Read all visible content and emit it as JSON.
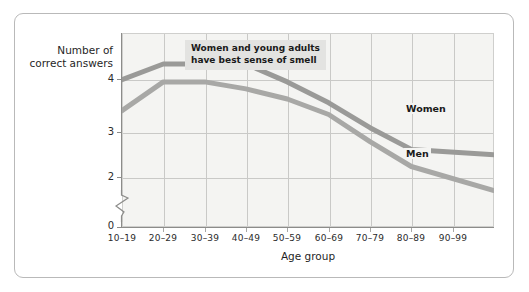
{
  "chart_data": {
    "type": "line",
    "title": "",
    "subtitle": "",
    "xlabel": "Age group",
    "ylabel": "Number of correct answers",
    "categories": [
      "10–19",
      "20–29",
      "30–39",
      "40–49",
      "50–59",
      "60–69",
      "70–79",
      "80–89",
      "90–99"
    ],
    "ytick_labels": [
      "0",
      "2",
      "3",
      "4"
    ],
    "ytick_values": [
      0,
      2,
      3,
      4
    ],
    "ylim": [
      1.85,
      4.35
    ],
    "y_axis_break": true,
    "grid": true,
    "legend_position": "inline-right",
    "series": [
      {
        "name": "Women",
        "color": "#9a9a98",
        "values": [
          3.75,
          3.95,
          3.95,
          3.95,
          3.72,
          3.45,
          3.13,
          2.85,
          2.78
        ]
      },
      {
        "name": "Men",
        "color": "#a8a8a6",
        "values": [
          3.35,
          3.72,
          3.72,
          3.63,
          3.5,
          3.3,
          2.95,
          2.63,
          2.32
        ]
      }
    ],
    "annotations": [
      {
        "name": "callout",
        "line1": "Women and young adults",
        "line2": "have best sense of smell"
      }
    ]
  },
  "axis": {
    "y_title_line1": "Number of",
    "y_title_line2": "correct answers",
    "x_title": "Age group"
  },
  "series_labels": {
    "women": "Women",
    "men": "Men"
  },
  "colors": {
    "plot_background": "#f4f4f2",
    "grid": "#c9c9c7",
    "axis": "#8c8c8a",
    "women_line": "#9a9a98",
    "men_line": "#a8a8a6",
    "annotation_background": "#e3e3e1",
    "card_border": "#b9b9b9",
    "text": "#1f1f1f"
  }
}
